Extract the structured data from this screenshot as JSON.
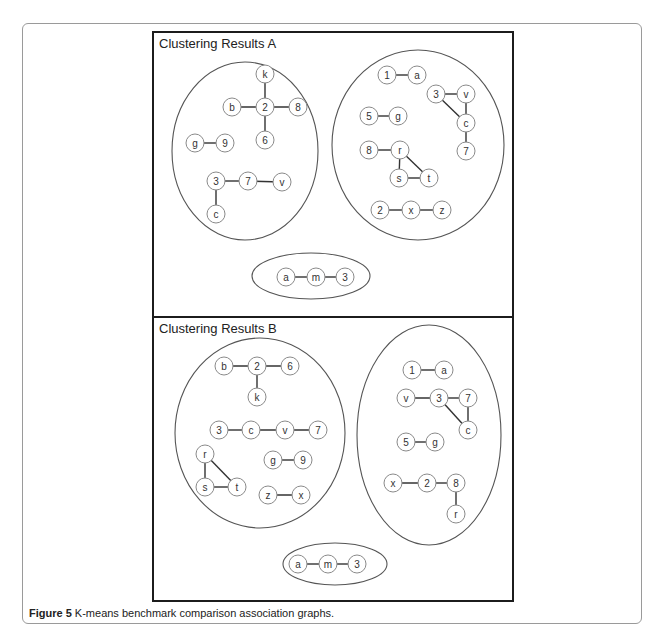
{
  "figure": {
    "caption_label": "Figure 5",
    "caption_text": " K-means benchmark comparison association graphs."
  },
  "panels": [
    {
      "id": "A",
      "title": "Clustering Results A",
      "clusters": [
        {
          "name": "cluster-a-left",
          "ellipse": {
            "cx": 245,
            "cy": 151,
            "rx": 73,
            "ry": 89
          },
          "nodes": [
            {
              "id": "k",
              "x": 265,
              "y": 74
            },
            {
              "id": "b",
              "x": 232,
              "y": 107
            },
            {
              "id": "2",
              "x": 265,
              "y": 107
            },
            {
              "id": "8",
              "x": 298,
              "y": 107
            },
            {
              "id": "6",
              "x": 265,
              "y": 140
            },
            {
              "id": "g",
              "x": 195,
              "y": 143
            },
            {
              "id": "9",
              "x": 225,
              "y": 143
            },
            {
              "id": "3",
              "x": 216,
              "y": 181
            },
            {
              "id": "7",
              "x": 248,
              "y": 181
            },
            {
              "id": "v",
              "x": 282,
              "y": 182
            },
            {
              "id": "c",
              "x": 216,
              "y": 214
            }
          ],
          "edges": [
            [
              0,
              2
            ],
            [
              1,
              2
            ],
            [
              2,
              3
            ],
            [
              2,
              4
            ],
            [
              5,
              6
            ],
            [
              7,
              8
            ],
            [
              8,
              9
            ],
            [
              7,
              10
            ]
          ]
        },
        {
          "name": "cluster-a-right",
          "ellipse": {
            "cx": 418,
            "cy": 145,
            "rx": 86,
            "ry": 95
          },
          "nodes": [
            {
              "id": "1",
              "x": 387,
              "y": 75
            },
            {
              "id": "a",
              "x": 417,
              "y": 75
            },
            {
              "id": "3",
              "x": 436,
              "y": 94
            },
            {
              "id": "v",
              "x": 466,
              "y": 94
            },
            {
              "id": "c",
              "x": 466,
              "y": 123
            },
            {
              "id": "7",
              "x": 466,
              "y": 151
            },
            {
              "id": "5",
              "x": 369,
              "y": 116
            },
            {
              "id": "g",
              "x": 398,
              "y": 116
            },
            {
              "id": "8",
              "x": 369,
              "y": 150
            },
            {
              "id": "r",
              "x": 400,
              "y": 150
            },
            {
              "id": "s",
              "x": 399,
              "y": 178
            },
            {
              "id": "t",
              "x": 429,
              "y": 178
            },
            {
              "id": "2",
              "x": 380,
              "y": 210
            },
            {
              "id": "x",
              "x": 411,
              "y": 210
            },
            {
              "id": "z",
              "x": 442,
              "y": 210
            }
          ],
          "edges": [
            [
              0,
              1
            ],
            [
              2,
              3
            ],
            [
              3,
              4
            ],
            [
              2,
              4
            ],
            [
              4,
              5
            ],
            [
              6,
              7
            ],
            [
              8,
              9
            ],
            [
              9,
              10
            ],
            [
              10,
              11
            ],
            [
              9,
              11
            ],
            [
              12,
              13
            ],
            [
              13,
              14
            ]
          ]
        },
        {
          "name": "cluster-a-bottom",
          "ellipse": {
            "cx": 311,
            "cy": 276,
            "rx": 59,
            "ry": 23
          },
          "nodes": [
            {
              "id": "a",
              "x": 286,
              "y": 277
            },
            {
              "id": "m",
              "x": 316,
              "y": 277
            },
            {
              "id": "3",
              "x": 345,
              "y": 277
            }
          ],
          "edges": [
            [
              0,
              1
            ],
            [
              1,
              2
            ]
          ]
        }
      ]
    },
    {
      "id": "B",
      "title": "Clustering Results B",
      "clusters": [
        {
          "name": "cluster-b-left",
          "ellipse": {
            "cx": 260,
            "cy": 433,
            "rx": 85,
            "ry": 95
          },
          "nodes": [
            {
              "id": "b",
              "x": 224,
              "y": 366
            },
            {
              "id": "2",
              "x": 257,
              "y": 366
            },
            {
              "id": "6",
              "x": 290,
              "y": 366
            },
            {
              "id": "k",
              "x": 257,
              "y": 397
            },
            {
              "id": "3",
              "x": 219,
              "y": 430
            },
            {
              "id": "c",
              "x": 251,
              "y": 430
            },
            {
              "id": "v",
              "x": 285,
              "y": 430
            },
            {
              "id": "7",
              "x": 318,
              "y": 430
            },
            {
              "id": "r",
              "x": 205,
              "y": 454
            },
            {
              "id": "s",
              "x": 205,
              "y": 487
            },
            {
              "id": "t",
              "x": 237,
              "y": 487
            },
            {
              "id": "g",
              "x": 273,
              "y": 460
            },
            {
              "id": "9",
              "x": 303,
              "y": 460
            },
            {
              "id": "z",
              "x": 268,
              "y": 495
            },
            {
              "id": "x",
              "x": 301,
              "y": 495
            }
          ],
          "edges": [
            [
              0,
              1
            ],
            [
              1,
              2
            ],
            [
              1,
              3
            ],
            [
              4,
              5
            ],
            [
              5,
              6
            ],
            [
              6,
              7
            ],
            [
              8,
              9
            ],
            [
              9,
              10
            ],
            [
              8,
              10
            ],
            [
              11,
              12
            ],
            [
              13,
              14
            ]
          ]
        },
        {
          "name": "cluster-b-right",
          "ellipse": {
            "cx": 429,
            "cy": 435,
            "rx": 72,
            "ry": 110
          },
          "nodes": [
            {
              "id": "1",
              "x": 412,
              "y": 370
            },
            {
              "id": "a",
              "x": 444,
              "y": 370
            },
            {
              "id": "v",
              "x": 406,
              "y": 398
            },
            {
              "id": "3",
              "x": 439,
              "y": 398
            },
            {
              "id": "7",
              "x": 468,
              "y": 398
            },
            {
              "id": "c",
              "x": 468,
              "y": 430
            },
            {
              "id": "5",
              "x": 406,
              "y": 442
            },
            {
              "id": "g",
              "x": 435,
              "y": 442
            },
            {
              "id": "x",
              "x": 393,
              "y": 483
            },
            {
              "id": "2",
              "x": 427,
              "y": 483
            },
            {
              "id": "8",
              "x": 456,
              "y": 483
            },
            {
              "id": "r",
              "x": 456,
              "y": 514
            }
          ],
          "edges": [
            [
              0,
              1
            ],
            [
              2,
              3
            ],
            [
              3,
              4
            ],
            [
              4,
              5
            ],
            [
              3,
              5
            ],
            [
              6,
              7
            ],
            [
              8,
              9
            ],
            [
              9,
              10
            ],
            [
              10,
              11
            ]
          ]
        },
        {
          "name": "cluster-b-bottom",
          "ellipse": {
            "cx": 335,
            "cy": 564,
            "rx": 52,
            "ry": 21
          },
          "nodes": [
            {
              "id": "a",
              "x": 298,
              "y": 564
            },
            {
              "id": "m",
              "x": 328,
              "y": 564
            },
            {
              "id": "3",
              "x": 357,
              "y": 564
            }
          ],
          "edges": [
            [
              0,
              1
            ],
            [
              1,
              2
            ]
          ]
        }
      ]
    }
  ],
  "colors": {
    "panel_border": "#1c1c1c",
    "frame_border": "#9a9a9a",
    "node_stroke": "#8a8a8a",
    "edge": "#333333",
    "cluster_stroke": "#555555"
  }
}
